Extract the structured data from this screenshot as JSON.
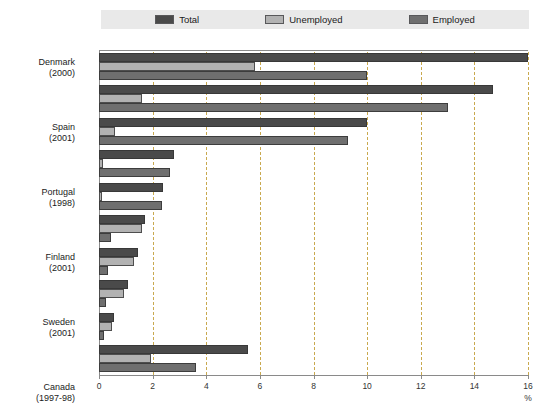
{
  "legend": {
    "entries": [
      {
        "label": "Total",
        "color": "#4a4a4a",
        "icon": "legend-swatch-icon"
      },
      {
        "label": "Unemployed",
        "color": "#b2b2b2",
        "icon": "legend-swatch-icon"
      },
      {
        "label": "Employed",
        "color": "#6f6f6f",
        "icon": "legend-swatch-icon"
      }
    ],
    "background": "#e9e9e9"
  },
  "axis": {
    "x_unit_label": "%",
    "x_ticks": [
      "0",
      "2",
      "4",
      "6",
      "8",
      "10",
      "12",
      "14",
      "16"
    ]
  },
  "chart_data": {
    "type": "bar",
    "orientation": "horizontal",
    "title": "",
    "subtitle": "",
    "xlabel": "%",
    "ylabel": "",
    "xlim": [
      0,
      16
    ],
    "xtick_step": 2,
    "grid": "vertical-dashed",
    "legend_position": "top-center",
    "categories": [
      "Denmark\n(2000)",
      "Spain\n(2001)",
      "Portugal\n(1998)",
      "Finland\n(2001)",
      "Sweden\n(2001)",
      "Canada\n(1997-98)",
      "Switzerland\n(2001)",
      "Norway\n(2001)",
      "United Kingdom\n(1999-2000)",
      "Unweighted average\n(9 countries)"
    ],
    "category_labels": [
      {
        "name": "Denmark",
        "period": "(2000)"
      },
      {
        "name": "Spain",
        "period": "(2001)"
      },
      {
        "name": "Portugal",
        "period": "(1998)"
      },
      {
        "name": "Finland",
        "period": "(2001)"
      },
      {
        "name": "Sweden",
        "period": "(2001)"
      },
      {
        "name": "Canada",
        "period": "(1997-98)"
      },
      {
        "name": "Switzerland",
        "period": "(2001)"
      },
      {
        "name": "Norway",
        "period": "(2001)"
      },
      {
        "name": "United Kingdom",
        "period": "(1999-2000)"
      },
      {
        "name": "Unweighted average",
        "period": "(9 countries)"
      }
    ],
    "series": [
      {
        "name": "Total",
        "color": "#4a4a4a",
        "values": [
          16.0,
          14.7,
          10.0,
          2.8,
          2.4,
          1.7,
          1.45,
          1.1,
          0.55,
          5.55
        ]
      },
      {
        "name": "Unemployed",
        "color": "#b2b2b2",
        "values": [
          5.8,
          1.6,
          0.6,
          0.15,
          0.1,
          1.6,
          1.3,
          0.95,
          0.5,
          1.95
        ]
      },
      {
        "name": "Employed",
        "color": "#6f6f6f",
        "values": [
          10.0,
          13.0,
          9.3,
          2.65,
          2.35,
          0.45,
          0.35,
          0.25,
          0.2,
          3.6
        ]
      }
    ]
  }
}
